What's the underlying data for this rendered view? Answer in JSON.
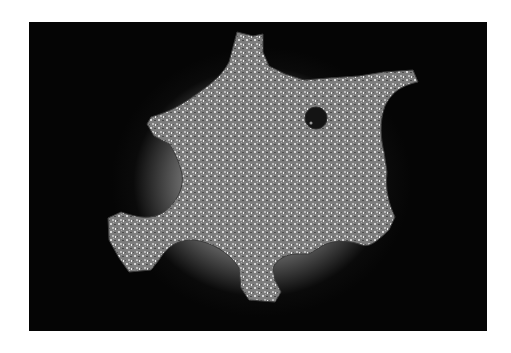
{
  "image": {
    "subject": "Star-shaped granular stone specimen photographed on black background",
    "background_color": "#050505",
    "border_color": "#ffffff",
    "specimen_color": "#8a8a8a",
    "glow_color": "#e0e0e0",
    "features": [
      "six-pointed irregular outline",
      "speckled granular texture",
      "small dark round hole near upper right"
    ]
  }
}
